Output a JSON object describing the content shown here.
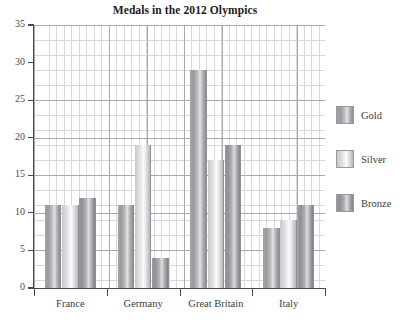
{
  "chart_data": {
    "type": "bar",
    "title": "Medals in the 2012 Olympics",
    "xlabel": "",
    "ylabel": "",
    "categories": [
      "France",
      "Germany",
      "Great Britain",
      "Italy"
    ],
    "series": [
      {
        "name": "Gold",
        "values": [
          11,
          11,
          29,
          8
        ]
      },
      {
        "name": "Silver",
        "values": [
          11,
          19,
          17,
          9
        ]
      },
      {
        "name": "Bronze",
        "values": [
          12,
          4,
          19,
          11
        ]
      }
    ],
    "ylim": [
      0,
      35
    ],
    "ytick_labels": [
      "0",
      "5",
      "10",
      "15",
      "20",
      "25",
      "30",
      "35"
    ],
    "ytick_values": [
      0,
      5,
      10,
      15,
      20,
      25,
      30,
      35
    ],
    "grid": "both-axes-minor-and-major",
    "legend_position": "right",
    "colors": {
      "gold": "#b0b0b4",
      "silver": "#dcdce0",
      "bronze": "#a2a2a6",
      "axis": "#4a4a4a",
      "grid_major": "#a8a8ae",
      "grid_minor": "#d9d9dd",
      "title": "#1c1c1c"
    }
  }
}
